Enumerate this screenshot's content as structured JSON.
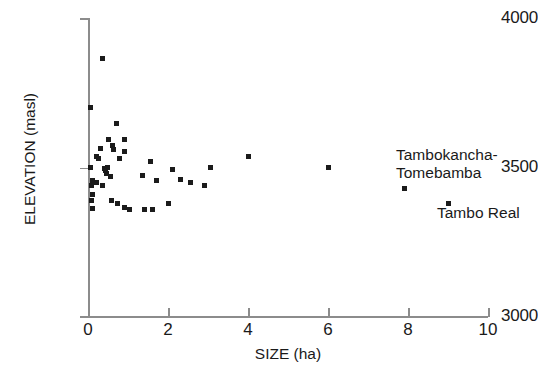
{
  "chart_data": {
    "type": "scatter",
    "title": "",
    "xlabel": "SIZE (ha)",
    "ylabel": "ELEVATION (masl)",
    "xlim": [
      0,
      10
    ],
    "ylim": [
      3000,
      4000
    ],
    "xticks": [
      0,
      2,
      4,
      6,
      8,
      10
    ],
    "yticks": [
      3000,
      3500,
      4000
    ],
    "xtick_labels": [
      "0",
      "2",
      "4",
      "6",
      "8",
      "10"
    ],
    "ytick_labels": [
      "3000",
      "3500",
      "4000"
    ],
    "grid": false,
    "legend": null,
    "marker": "square",
    "marker_color": "#1b1b1b",
    "points": [
      {
        "x": 0.05,
        "y": 3700
      },
      {
        "x": 0.37,
        "y": 3863
      },
      {
        "x": 0.72,
        "y": 3648
      },
      {
        "x": 0.52,
        "y": 3592
      },
      {
        "x": 0.92,
        "y": 3592
      },
      {
        "x": 0.3,
        "y": 3562
      },
      {
        "x": 0.62,
        "y": 3572
      },
      {
        "x": 0.64,
        "y": 3558
      },
      {
        "x": 0.9,
        "y": 3552
      },
      {
        "x": 0.2,
        "y": 3535
      },
      {
        "x": 0.26,
        "y": 3528
      },
      {
        "x": 0.78,
        "y": 3528
      },
      {
        "x": 0.12,
        "y": 3455
      },
      {
        "x": 0.05,
        "y": 3500
      },
      {
        "x": 0.42,
        "y": 3495
      },
      {
        "x": 0.48,
        "y": 3500
      },
      {
        "x": 0.44,
        "y": 3488
      },
      {
        "x": 0.46,
        "y": 3480
      },
      {
        "x": 0.55,
        "y": 3470
      },
      {
        "x": 1.55,
        "y": 3520
      },
      {
        "x": 0.08,
        "y": 3440
      },
      {
        "x": 0.22,
        "y": 3448
      },
      {
        "x": 0.36,
        "y": 3438
      },
      {
        "x": 0.1,
        "y": 3410
      },
      {
        "x": 0.08,
        "y": 3388
      },
      {
        "x": 0.1,
        "y": 3362
      },
      {
        "x": 0.58,
        "y": 3388
      },
      {
        "x": 0.74,
        "y": 3378
      },
      {
        "x": 0.92,
        "y": 3365
      },
      {
        "x": 1.04,
        "y": 3358
      },
      {
        "x": 1.42,
        "y": 3358
      },
      {
        "x": 1.6,
        "y": 3358
      },
      {
        "x": 1.35,
        "y": 3472
      },
      {
        "x": 1.72,
        "y": 3455
      },
      {
        "x": 2.0,
        "y": 3378
      },
      {
        "x": 2.1,
        "y": 3492
      },
      {
        "x": 2.3,
        "y": 3460
      },
      {
        "x": 2.55,
        "y": 3448
      },
      {
        "x": 2.9,
        "y": 3440
      },
      {
        "x": 4.0,
        "y": 3535
      },
      {
        "x": 3.05,
        "y": 3500
      },
      {
        "x": 6.0,
        "y": 3498
      },
      {
        "x": 7.9,
        "y": 3430
      },
      {
        "x": 9.0,
        "y": 3378
      }
    ],
    "annotations": [
      {
        "text_line1": "Tambokancha-",
        "text_line2": "Tomebamba",
        "target_x": 7.9,
        "target_y": 3430
      },
      {
        "text_line1": "Tambo Real",
        "text_line2": "",
        "target_x": 9.0,
        "target_y": 3378
      }
    ]
  }
}
